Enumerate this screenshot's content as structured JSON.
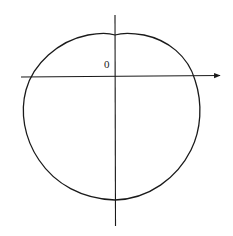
{
  "figure": {
    "type": "closed-curve-on-axes",
    "origin_label": "0",
    "colors": {
      "background": "#ffffff",
      "stroke": "#1a1a1a"
    },
    "axes": {
      "horizontal": {
        "x1": 21,
        "y": 77,
        "x2": 218,
        "arrow": true
      },
      "vertical": {
        "x": 115,
        "y1": 15,
        "y2": 226,
        "arrow": false
      }
    },
    "curve": {
      "description": "Closed roughly circular curve, slightly flattened on top with a small dip at the vertical axis, crossing the horizontal axis on both sides",
      "extremes": {
        "top": [
          115,
          34
        ],
        "left": [
          23,
          108
        ],
        "right": [
          201,
          110
        ],
        "bottom": [
          115,
          200
        ]
      },
      "axis_crossings": {
        "horizontal_left": [
          31,
          77
        ],
        "horizontal_right": [
          193,
          77
        ]
      }
    }
  }
}
